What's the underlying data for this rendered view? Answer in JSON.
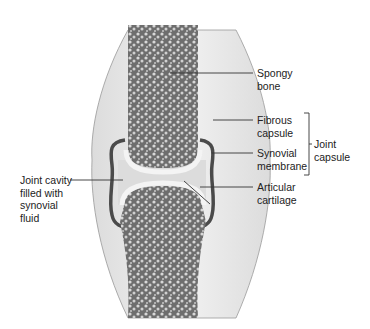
{
  "diagram": {
    "labels": {
      "spongy_bone": [
        "Spongy",
        "bone"
      ],
      "fibrous_capsule": [
        "Fibrous",
        "capsule"
      ],
      "synovial_membrane": [
        "Synovial",
        "membrane"
      ],
      "joint_capsule": [
        "Joint",
        "capsule"
      ],
      "articular_cartilage": [
        "Articular",
        "cartilage"
      ],
      "joint_cavity": [
        "Joint cavity",
        "filled with",
        "synovial",
        "fluid"
      ]
    },
    "colors": {
      "bone": "#8a8a8a",
      "bone_dark": "#5a5a5a",
      "capsule": "#e6e6e6",
      "membrane": "#4a4a4a",
      "cartilage": "#f4f4f4",
      "cavity": "#dcdcdc",
      "line": "#333333"
    }
  }
}
